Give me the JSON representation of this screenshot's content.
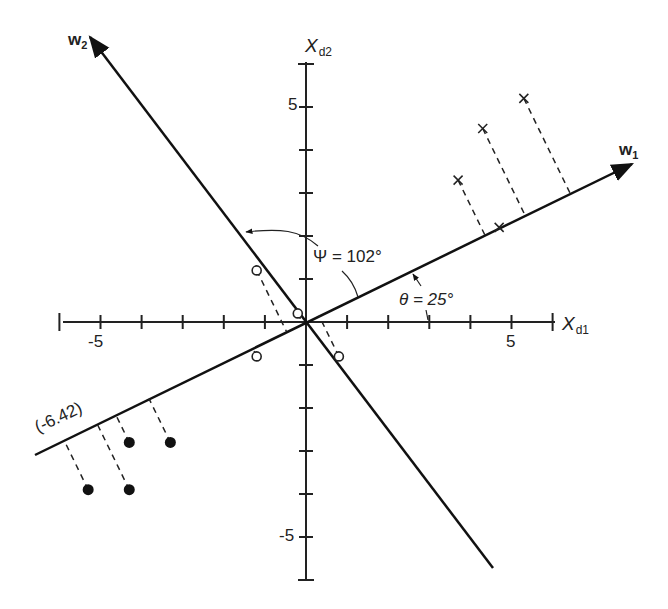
{
  "diagram": {
    "axes": {
      "x": {
        "name": "X",
        "subscript": "d1",
        "ticks": [
          -6,
          -5,
          -4,
          -3,
          -2,
          -1,
          1,
          2,
          3,
          4,
          5,
          6
        ],
        "labeled_ticks": [
          {
            "value": -5,
            "label": "-5"
          },
          {
            "value": 5,
            "label": "5"
          }
        ]
      },
      "y": {
        "name": "X",
        "subscript": "d2",
        "ticks": [
          -6,
          -5,
          -4,
          -3,
          -2,
          -1,
          1,
          2,
          3,
          4,
          5,
          6
        ],
        "labeled_ticks": [
          {
            "value": 5,
            "label": "5"
          },
          {
            "value": -5,
            "label": "-5"
          }
        ]
      }
    },
    "vectors": {
      "w1": {
        "name": "w",
        "subscript": "1",
        "angle_deg": 25
      },
      "w2": {
        "name": "w",
        "subscript": "2",
        "angle_deg": 127
      }
    },
    "annotations": {
      "psi": "Ψ = 102°",
      "theta": "θ = 25°",
      "projection_value": "(-6.42)"
    },
    "points": {
      "crosses": [
        [
          3.7,
          3.3
        ],
        [
          4.3,
          4.5
        ],
        [
          5.3,
          5.2
        ],
        [
          4.7,
          2.2
        ]
      ],
      "open_circles": [
        [
          -1.2,
          1.2
        ],
        [
          -0.2,
          0.2
        ],
        [
          0.8,
          -0.8
        ],
        [
          -1.2,
          -0.8
        ]
      ],
      "filled_circles": [
        [
          -3.3,
          -2.8
        ],
        [
          -4.3,
          -2.8
        ],
        [
          -5.3,
          -3.9
        ],
        [
          -4.3,
          -3.9
        ]
      ]
    }
  },
  "chart_data": {
    "type": "scatter",
    "title": "",
    "xlabel": "X_d1",
    "ylabel": "X_d2",
    "xlim": [
      -6,
      6
    ],
    "ylim": [
      -6,
      6
    ],
    "grid": false,
    "series": [
      {
        "name": "class x",
        "marker": "x",
        "points": [
          [
            3.7,
            3.3
          ],
          [
            4.3,
            4.5
          ],
          [
            5.3,
            5.2
          ],
          [
            4.7,
            2.2
          ]
        ]
      },
      {
        "name": "class o",
        "marker": "open-circle",
        "points": [
          [
            -1.2,
            1.2
          ],
          [
            -0.2,
            0.2
          ],
          [
            0.8,
            -0.8
          ],
          [
            -1.2,
            -0.8
          ]
        ]
      },
      {
        "name": "class filled",
        "marker": "filled-circle",
        "points": [
          [
            -3.3,
            -2.8
          ],
          [
            -4.3,
            -2.8
          ],
          [
            -5.3,
            -3.9
          ],
          [
            -4.3,
            -3.9
          ]
        ]
      }
    ],
    "lines": [
      {
        "name": "w1",
        "angle_deg": 25
      },
      {
        "name": "w2",
        "angle_deg": 127
      }
    ],
    "annotations": [
      "Ψ = 102°",
      "θ = 25°",
      "(-6.42)"
    ]
  }
}
